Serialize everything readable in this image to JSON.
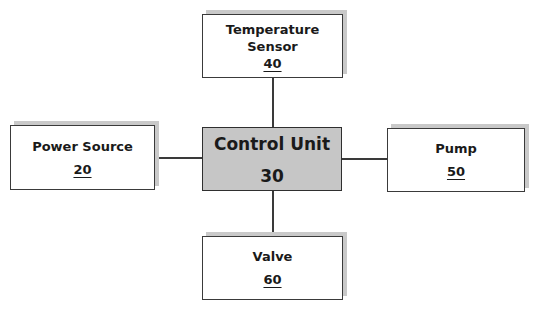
{
  "diagram": {
    "type": "block-diagram",
    "nodes": [
      {
        "id": "control-unit",
        "label": "Control Unit",
        "ref": "30",
        "ref_underlined": false,
        "fill": "#c6c6c6"
      },
      {
        "id": "power-source",
        "label": "Power Source",
        "ref": "20",
        "ref_underlined": true
      },
      {
        "id": "temperature-sensor",
        "label": "Temperature Sensor",
        "label_lines": [
          "Temperature",
          "Sensor"
        ],
        "ref": "40",
        "ref_underlined": true
      },
      {
        "id": "pump",
        "label": "Pump",
        "ref": "50",
        "ref_underlined": true
      },
      {
        "id": "valve",
        "label": "Valve",
        "ref": "60",
        "ref_underlined": true
      }
    ],
    "edges": [
      {
        "from": "power-source",
        "to": "control-unit"
      },
      {
        "from": "temperature-sensor",
        "to": "control-unit"
      },
      {
        "from": "control-unit",
        "to": "pump"
      },
      {
        "from": "control-unit",
        "to": "valve"
      }
    ]
  }
}
